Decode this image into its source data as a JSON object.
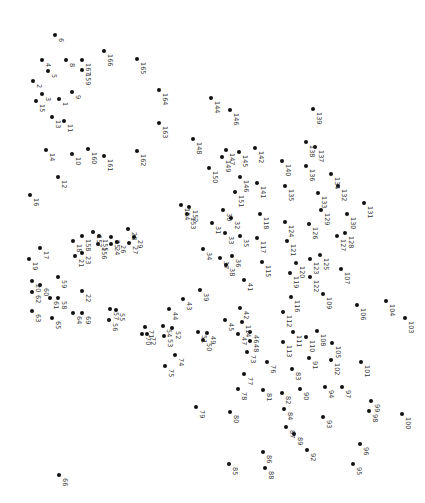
{
  "puzzle": {
    "type": "connect-the-dots",
    "label_rotation_deg": 90,
    "dot_color": "#111111",
    "label_color": "#333333",
    "dots": [
      {
        "n": "1",
        "x": 59,
        "y": 99
      },
      {
        "n": "2",
        "x": 33,
        "y": 81
      },
      {
        "n": "3",
        "x": 42,
        "y": 94
      },
      {
        "n": "4",
        "x": 42,
        "y": 60
      },
      {
        "n": "5",
        "x": 48,
        "y": 71
      },
      {
        "n": "6",
        "x": 55,
        "y": 35
      },
      {
        "n": "8",
        "x": 66,
        "y": 60
      },
      {
        "n": "9",
        "x": 72,
        "y": 92
      },
      {
        "n": "10",
        "x": 72,
        "y": 154
      },
      {
        "n": "11",
        "x": 64,
        "y": 121
      },
      {
        "n": "12",
        "x": 58,
        "y": 177
      },
      {
        "n": "13",
        "x": 52,
        "y": 117
      },
      {
        "n": "14",
        "x": 46,
        "y": 150
      },
      {
        "n": "15",
        "x": 36,
        "y": 101
      },
      {
        "n": "16",
        "x": 30,
        "y": 195
      },
      {
        "n": "17",
        "x": 40,
        "y": 248
      },
      {
        "n": "18",
        "x": 73,
        "y": 241
      },
      {
        "n": "19",
        "x": 29,
        "y": 259
      },
      {
        "n": "20",
        "x": 32,
        "y": 281
      },
      {
        "n": "21",
        "x": 75,
        "y": 256
      },
      {
        "n": "22",
        "x": 82,
        "y": 291
      },
      {
        "n": "23",
        "x": 82,
        "y": 253
      },
      {
        "n": "24",
        "x": 111,
        "y": 244
      },
      {
        "n": "25",
        "x": 111,
        "y": 237
      },
      {
        "n": "26",
        "x": 117,
        "y": 242
      },
      {
        "n": "27",
        "x": 129,
        "y": 243
      },
      {
        "n": "28",
        "x": 128,
        "y": 229
      },
      {
        "n": "29",
        "x": 134,
        "y": 237
      },
      {
        "n": "30",
        "x": 223,
        "y": 210
      },
      {
        "n": "31",
        "x": 212,
        "y": 223
      },
      {
        "n": "32",
        "x": 231,
        "y": 218
      },
      {
        "n": "33",
        "x": 225,
        "y": 233
      },
      {
        "n": "34",
        "x": 203,
        "y": 249
      },
      {
        "n": "35",
        "x": 240,
        "y": 236
      },
      {
        "n": "36",
        "x": 232,
        "y": 256
      },
      {
        "n": "37",
        "x": 220,
        "y": 258
      },
      {
        "n": "38",
        "x": 226,
        "y": 265
      },
      {
        "n": "39",
        "x": 200,
        "y": 290
      },
      {
        "n": "41",
        "x": 244,
        "y": 280
      },
      {
        "n": "42",
        "x": 240,
        "y": 308
      },
      {
        "n": "43",
        "x": 183,
        "y": 299
      },
      {
        "n": "44",
        "x": 169,
        "y": 309
      },
      {
        "n": "45",
        "x": 225,
        "y": 320
      },
      {
        "n": "46",
        "x": 250,
        "y": 332
      },
      {
        "n": "47",
        "x": 238,
        "y": 334
      },
      {
        "n": "48",
        "x": 250,
        "y": 341
      },
      {
        "n": "49",
        "x": 207,
        "y": 333
      },
      {
        "n": "50",
        "x": 203,
        "y": 340
      },
      {
        "n": "51",
        "x": 198,
        "y": 332
      },
      {
        "n": "52",
        "x": 172,
        "y": 328
      },
      {
        "n": "53",
        "x": 164,
        "y": 336
      },
      {
        "n": "54",
        "x": 163,
        "y": 326
      },
      {
        "n": "55",
        "x": 116,
        "y": 310
      },
      {
        "n": "56",
        "x": 109,
        "y": 320
      },
      {
        "n": "57",
        "x": 110,
        "y": 309
      },
      {
        "n": "58",
        "x": 58,
        "y": 298
      },
      {
        "n": "59",
        "x": 58,
        "y": 277
      },
      {
        "n": "60",
        "x": 40,
        "y": 285
      },
      {
        "n": "61",
        "x": 50,
        "y": 298
      },
      {
        "n": "62",
        "x": 32,
        "y": 292
      },
      {
        "n": "63",
        "x": 32,
        "y": 311
      },
      {
        "n": "64",
        "x": 73,
        "y": 313
      },
      {
        "n": "65",
        "x": 52,
        "y": 318
      },
      {
        "n": "66",
        "x": 59,
        "y": 475
      },
      {
        "n": "69",
        "x": 82,
        "y": 313
      },
      {
        "n": "70",
        "x": 142,
        "y": 334
      },
      {
        "n": "71",
        "x": 145,
        "y": 327
      },
      {
        "n": "72",
        "x": 147,
        "y": 334
      },
      {
        "n": "73",
        "x": 247,
        "y": 352
      },
      {
        "n": "74",
        "x": 175,
        "y": 355
      },
      {
        "n": "75",
        "x": 165,
        "y": 366
      },
      {
        "n": "76",
        "x": 267,
        "y": 362
      },
      {
        "n": "77",
        "x": 244,
        "y": 374
      },
      {
        "n": "78",
        "x": 238,
        "y": 389
      },
      {
        "n": "79",
        "x": 196,
        "y": 407
      },
      {
        "n": "80",
        "x": 230,
        "y": 412
      },
      {
        "n": "81",
        "x": 263,
        "y": 390
      },
      {
        "n": "82",
        "x": 282,
        "y": 393
      },
      {
        "n": "83",
        "x": 292,
        "y": 369
      },
      {
        "n": "84",
        "x": 284,
        "y": 409
      },
      {
        "n": "85",
        "x": 229,
        "y": 464
      },
      {
        "n": "86",
        "x": 263,
        "y": 452
      },
      {
        "n": "87",
        "x": 286,
        "y": 427
      },
      {
        "n": "88",
        "x": 265,
        "y": 468
      },
      {
        "n": "89",
        "x": 294,
        "y": 434
      },
      {
        "n": "90",
        "x": 300,
        "y": 389
      },
      {
        "n": "91",
        "x": 309,
        "y": 358
      },
      {
        "n": "92",
        "x": 307,
        "y": 450
      },
      {
        "n": "93",
        "x": 323,
        "y": 417
      },
      {
        "n": "94",
        "x": 325,
        "y": 387
      },
      {
        "n": "95",
        "x": 353,
        "y": 464
      },
      {
        "n": "96",
        "x": 360,
        "y": 444
      },
      {
        "n": "97",
        "x": 342,
        "y": 387
      },
      {
        "n": "98",
        "x": 369,
        "y": 411
      },
      {
        "n": "99",
        "x": 371,
        "y": 401
      },
      {
        "n": "100",
        "x": 402,
        "y": 414
      },
      {
        "n": "101",
        "x": 361,
        "y": 362
      },
      {
        "n": "102",
        "x": 331,
        "y": 360
      },
      {
        "n": "103",
        "x": 405,
        "y": 318
      },
      {
        "n": "104",
        "x": 386,
        "y": 301
      },
      {
        "n": "105",
        "x": 332,
        "y": 343
      },
      {
        "n": "106",
        "x": 357,
        "y": 305
      },
      {
        "n": "107",
        "x": 341,
        "y": 269
      },
      {
        "n": "108",
        "x": 317,
        "y": 331
      },
      {
        "n": "109",
        "x": 323,
        "y": 294
      },
      {
        "n": "110",
        "x": 306,
        "y": 337
      },
      {
        "n": "111",
        "x": 293,
        "y": 332
      },
      {
        "n": "112",
        "x": 283,
        "y": 312
      },
      {
        "n": "113",
        "x": 283,
        "y": 342
      },
      {
        "n": "114",
        "x": 242,
        "y": 322
      },
      {
        "n": "115",
        "x": 262,
        "y": 262
      },
      {
        "n": "116",
        "x": 291,
        "y": 297
      },
      {
        "n": "117",
        "x": 257,
        "y": 238
      },
      {
        "n": "118",
        "x": 260,
        "y": 214
      },
      {
        "n": "119",
        "x": 290,
        "y": 273
      },
      {
        "n": "120",
        "x": 296,
        "y": 263
      },
      {
        "n": "121",
        "x": 287,
        "y": 241
      },
      {
        "n": "122",
        "x": 310,
        "y": 277
      },
      {
        "n": "123",
        "x": 310,
        "y": 259
      },
      {
        "n": "124",
        "x": 285,
        "y": 222
      },
      {
        "n": "125",
        "x": 320,
        "y": 255
      },
      {
        "n": "126",
        "x": 309,
        "y": 224
      },
      {
        "n": "127",
        "x": 337,
        "y": 236
      },
      {
        "n": "128",
        "x": 345,
        "y": 233
      },
      {
        "n": "129",
        "x": 321,
        "y": 210
      },
      {
        "n": "130",
        "x": 347,
        "y": 214
      },
      {
        "n": "131",
        "x": 364,
        "y": 203
      },
      {
        "n": "132",
        "x": 338,
        "y": 186
      },
      {
        "n": "133",
        "x": 318,
        "y": 193
      },
      {
        "n": "134",
        "x": 331,
        "y": 174
      },
      {
        "n": "135",
        "x": 285,
        "y": 186
      },
      {
        "n": "136",
        "x": 306,
        "y": 166
      },
      {
        "n": "137",
        "x": 315,
        "y": 147
      },
      {
        "n": "138",
        "x": 306,
        "y": 142
      },
      {
        "n": "139",
        "x": 313,
        "y": 109
      },
      {
        "n": "140",
        "x": 282,
        "y": 161
      },
      {
        "n": "141",
        "x": 257,
        "y": 183
      },
      {
        "n": "142",
        "x": 255,
        "y": 148
      },
      {
        "n": "144",
        "x": 211,
        "y": 98
      },
      {
        "n": "145",
        "x": 239,
        "y": 152
      },
      {
        "n": "146",
        "x": 240,
        "y": 177
      },
      {
        "n": "147",
        "x": 226,
        "y": 150
      },
      {
        "n": "148",
        "x": 193,
        "y": 139
      },
      {
        "n": "149",
        "x": 222,
        "y": 157
      },
      {
        "n": "150",
        "x": 209,
        "y": 168
      },
      {
        "n": "151",
        "x": 235,
        "y": 192
      },
      {
        "n": "152",
        "x": 189,
        "y": 207
      },
      {
        "n": "153",
        "x": 187,
        "y": 214
      },
      {
        "n": "154",
        "x": 181,
        "y": 205
      },
      {
        "n": "155",
        "x": 99,
        "y": 236
      },
      {
        "n": "156",
        "x": 98,
        "y": 244
      },
      {
        "n": "157",
        "x": 93,
        "y": 232
      },
      {
        "n": "158",
        "x": 82,
        "y": 236
      },
      {
        "n": "159",
        "x": 82,
        "y": 70
      },
      {
        "n": "160",
        "x": 88,
        "y": 149
      },
      {
        "n": "161",
        "x": 104,
        "y": 156
      },
      {
        "n": "162",
        "x": 137,
        "y": 151
      },
      {
        "n": "163",
        "x": 159,
        "y": 123
      },
      {
        "n": "164",
        "x": 159,
        "y": 90
      },
      {
        "n": "165",
        "x": 137,
        "y": 59
      },
      {
        "n": "166",
        "x": 104,
        "y": 51
      },
      {
        "n": "167",
        "x": 82,
        "y": 60
      },
      {
        "n": "146b",
        "x": 230,
        "y": 110
      }
    ]
  }
}
